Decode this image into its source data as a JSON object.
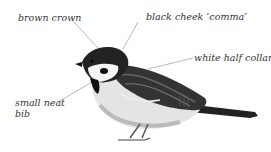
{
  "diagram": {
    "labels": [
      {
        "id": "brown-crown",
        "text": "brown crown"
      },
      {
        "id": "black-cheek",
        "text": "black cheek ‘comma’"
      },
      {
        "id": "white-collar",
        "text": "white half collar"
      },
      {
        "id": "bib-line1",
        "text": "small neat"
      },
      {
        "id": "bib-line2",
        "text": "bib"
      }
    ]
  }
}
